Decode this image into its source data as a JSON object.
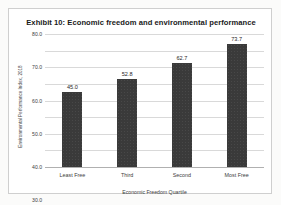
{
  "chart_data": {
    "type": "bar",
    "title": "Exhibit 10: Economic freedom and environmental performance",
    "categories": [
      "Least Free",
      "Third",
      "Second",
      "Most Free"
    ],
    "values": [
      45.0,
      52.8,
      62.7,
      73.7
    ],
    "value_labels": [
      "45.0",
      "52.8",
      "62.7",
      "73.7"
    ],
    "xlabel": "Economic Freedom Quartile",
    "ylabel": "Environmental Performance Index, 2018",
    "ylim": [
      0,
      80
    ],
    "ytick_labels": [
      "0.0",
      "10.0",
      "20.0",
      "30.0",
      "40.0",
      "50.0",
      "60.0",
      "70.0",
      "80.0"
    ],
    "ytick_values": [
      0,
      10,
      20,
      30,
      40,
      50,
      60,
      70,
      80
    ],
    "grid": true,
    "legend": false,
    "bar_color": "#3a3a3a",
    "gridline_color": "#d9d9d9",
    "background_color": "#ffffff"
  }
}
